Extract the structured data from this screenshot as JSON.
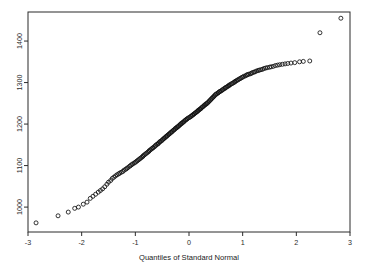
{
  "figure": {
    "background": "#ffffff",
    "marker_color": "#111111",
    "axis_color": "#2b2b2b",
    "frame": {
      "left": 28,
      "top": 12,
      "right": 350,
      "bottom": 232
    }
  },
  "chart_data": {
    "type": "scatter",
    "title": "",
    "subtitle": "",
    "xlabel": "Quantiles of Standard Normal",
    "ylabel": "",
    "xlim": [
      -3.0,
      3.0
    ],
    "ylim": [
      940,
      1470
    ],
    "grid": false,
    "legend": null,
    "xticks": [
      -3,
      -2,
      -1,
      0,
      1,
      2,
      3
    ],
    "xticklabels": [
      "-3",
      "-2",
      "-1",
      "0",
      "1",
      "2",
      "3"
    ],
    "yticks": [
      1000,
      1100,
      1200,
      1300,
      1400
    ],
    "yticklabels": [
      "1000",
      "1100",
      "1200",
      "1300",
      "1400"
    ],
    "ytick_label_rotation": 90,
    "marker": "open-circle",
    "marker_size_px": 4,
    "series": [
      {
        "name": "Sample Quantiles",
        "x": [
          -2.85,
          -2.44,
          -2.25,
          -2.13,
          -2.06,
          -1.97,
          -1.9,
          -1.84,
          -1.79,
          -1.74,
          -1.69,
          -1.65,
          -1.61,
          -1.57,
          -1.53,
          -1.5,
          -1.46,
          -1.43,
          -1.4,
          -1.37,
          -1.34,
          -1.31,
          -1.29,
          -1.26,
          -1.23,
          -1.21,
          -1.18,
          -1.16,
          -1.14,
          -1.11,
          -1.09,
          -1.07,
          -1.05,
          -1.02,
          -1.0,
          -0.98,
          -0.96,
          -0.94,
          -0.92,
          -0.9,
          -0.88,
          -0.86,
          -0.85,
          -0.83,
          -0.81,
          -0.79,
          -0.77,
          -0.75,
          -0.74,
          -0.72,
          -0.7,
          -0.68,
          -0.67,
          -0.65,
          -0.63,
          -0.62,
          -0.6,
          -0.58,
          -0.57,
          -0.55,
          -0.54,
          -0.52,
          -0.5,
          -0.49,
          -0.47,
          -0.46,
          -0.44,
          -0.43,
          -0.41,
          -0.4,
          -0.38,
          -0.37,
          -0.35,
          -0.34,
          -0.32,
          -0.31,
          -0.29,
          -0.28,
          -0.26,
          -0.25,
          -0.23,
          -0.22,
          -0.2,
          -0.19,
          -0.17,
          -0.16,
          -0.15,
          -0.13,
          -0.12,
          -0.1,
          -0.09,
          -0.07,
          -0.06,
          -0.04,
          -0.03,
          -0.01,
          0.01,
          0.03,
          0.04,
          0.06,
          0.07,
          0.09,
          0.1,
          0.12,
          0.13,
          0.15,
          0.16,
          0.17,
          0.19,
          0.2,
          0.22,
          0.23,
          0.25,
          0.26,
          0.28,
          0.29,
          0.31,
          0.32,
          0.34,
          0.35,
          0.37,
          0.38,
          0.4,
          0.41,
          0.43,
          0.44,
          0.46,
          0.47,
          0.49,
          0.5,
          0.52,
          0.54,
          0.55,
          0.57,
          0.58,
          0.6,
          0.62,
          0.63,
          0.65,
          0.67,
          0.68,
          0.7,
          0.72,
          0.74,
          0.75,
          0.77,
          0.79,
          0.81,
          0.83,
          0.85,
          0.86,
          0.88,
          0.9,
          0.92,
          0.94,
          0.96,
          0.98,
          1.0,
          1.02,
          1.05,
          1.07,
          1.09,
          1.11,
          1.14,
          1.16,
          1.18,
          1.21,
          1.23,
          1.26,
          1.29,
          1.31,
          1.34,
          1.37,
          1.4,
          1.43,
          1.46,
          1.5,
          1.53,
          1.57,
          1.61,
          1.65,
          1.69,
          1.74,
          1.79,
          1.84,
          1.9,
          1.97,
          2.06,
          2.13,
          2.25,
          2.44,
          2.83
        ],
        "y": [
          962,
          979,
          988,
          997,
          1000,
          1007,
          1012,
          1021,
          1026,
          1031,
          1036,
          1040,
          1044,
          1049,
          1055,
          1060,
          1064,
          1069,
          1072,
          1075,
          1078,
          1080,
          1082,
          1084,
          1086,
          1089,
          1091,
          1093,
          1095,
          1098,
          1100,
          1102,
          1104,
          1106,
          1108,
          1110,
          1112,
          1114,
          1116,
          1118,
          1120,
          1122,
          1124,
          1126,
          1128,
          1130,
          1132,
          1134,
          1136,
          1138,
          1140,
          1142,
          1143,
          1145,
          1147,
          1149,
          1151,
          1152,
          1154,
          1156,
          1158,
          1159,
          1161,
          1163,
          1165,
          1166,
          1168,
          1170,
          1171,
          1173,
          1175,
          1176,
          1178,
          1180,
          1181,
          1183,
          1185,
          1186,
          1188,
          1190,
          1191,
          1193,
          1194,
          1196,
          1198,
          1199,
          1201,
          1202,
          1204,
          1205,
          1207,
          1209,
          1210,
          1212,
          1213,
          1215,
          1216,
          1218,
          1219,
          1221,
          1222,
          1224,
          1225,
          1227,
          1228,
          1230,
          1231,
          1233,
          1234,
          1236,
          1237,
          1239,
          1241,
          1242,
          1244,
          1246,
          1247,
          1249,
          1250,
          1252,
          1254,
          1256,
          1258,
          1260,
          1262,
          1264,
          1266,
          1268,
          1270,
          1272,
          1273,
          1275,
          1276,
          1278,
          1279,
          1280,
          1282,
          1283,
          1285,
          1286,
          1288,
          1289,
          1291,
          1292,
          1294,
          1295,
          1297,
          1298,
          1300,
          1301,
          1303,
          1304,
          1306,
          1307,
          1309,
          1310,
          1312,
          1313,
          1315,
          1316,
          1318,
          1319,
          1320,
          1321,
          1322,
          1324,
          1325,
          1326,
          1328,
          1329,
          1330,
          1331,
          1332,
          1334,
          1335,
          1336,
          1337,
          1338,
          1339,
          1341,
          1342,
          1343,
          1344,
          1345,
          1346,
          1347,
          1348,
          1350,
          1351,
          1352,
          1420,
          1455
        ]
      }
    ]
  }
}
